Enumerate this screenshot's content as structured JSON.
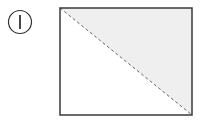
{
  "diagram": {
    "label": {
      "text": "I",
      "style": "circled-numeral"
    },
    "rectangle": {
      "x": 60,
      "y": 8,
      "width": 132,
      "height": 107,
      "stroke": "#3a3a3a",
      "fill": "#ffffff"
    },
    "shaded_region": {
      "shape": "triangle",
      "position": "upper-right",
      "fill": "#efefef"
    },
    "diagonal": {
      "from": "top-left",
      "to": "bottom-right",
      "style": "dashed",
      "stroke": "#555555"
    }
  }
}
